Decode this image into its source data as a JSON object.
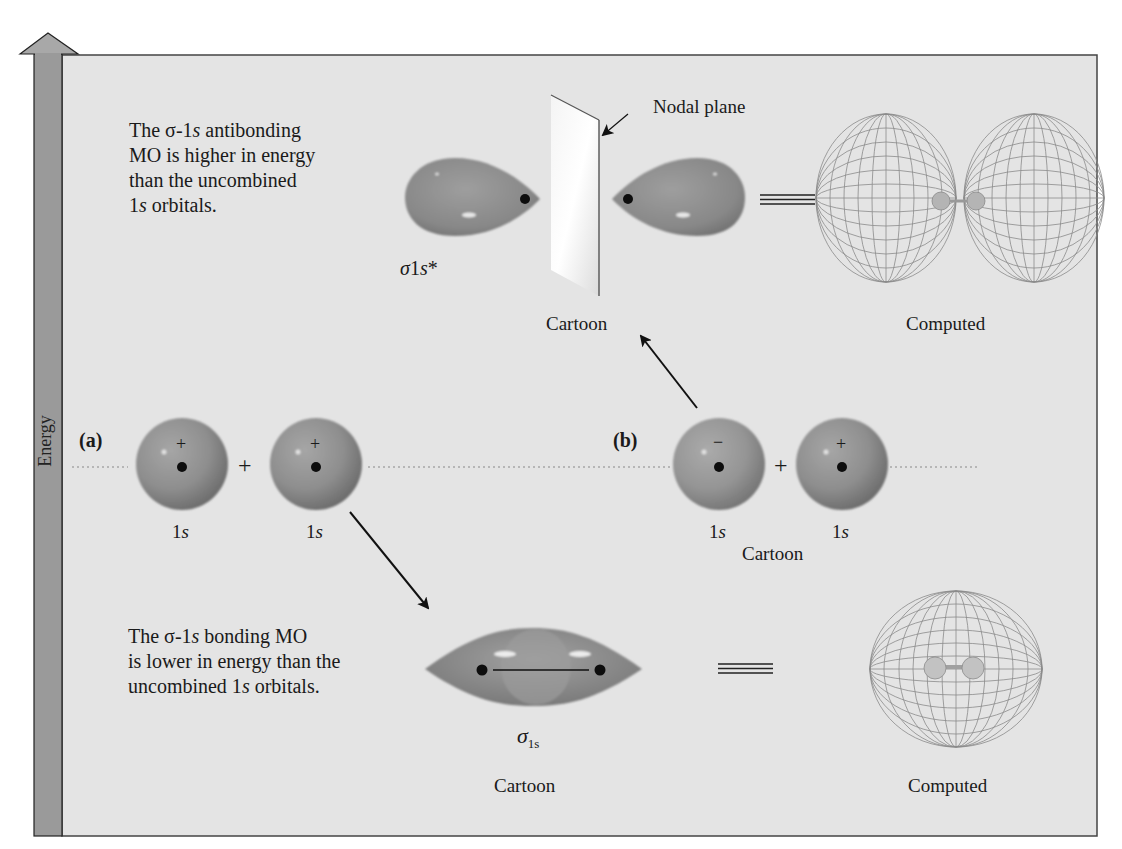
{
  "figure": {
    "axis": {
      "label": "Energy"
    },
    "antibonding": {
      "description_parts": [
        "The σ-1",
        "s",
        " antibonding",
        "MO is higher in energy",
        "than the uncombined",
        "1",
        "s",
        " orbitals."
      ],
      "symbol_sigma": "σ",
      "symbol_1": "1",
      "symbol_s": "s",
      "symbol_star": "*",
      "nodal_plane_label": "Nodal plane",
      "cartoon_label": "Cartoon",
      "computed_label": "Computed"
    },
    "row_a": {
      "tag": "(a)",
      "orbital_label_num": "1",
      "orbital_label_s": "s",
      "phase_left": "+",
      "phase_right": "+",
      "combine": "+"
    },
    "row_b": {
      "tag": "(b)",
      "orbital_label_num": "1",
      "orbital_label_s": "s",
      "phase_left": "−",
      "phase_right": "+",
      "combine": "+",
      "cartoon_label": "Cartoon"
    },
    "bonding": {
      "description_parts": [
        "The σ-1",
        "s",
        " bonding MO",
        "is lower in energy than the",
        "uncombined 1",
        "s",
        " orbitals."
      ],
      "symbol_sigma": "σ",
      "symbol_sub": "1s",
      "cartoon_label": "Cartoon",
      "computed_label": "Computed"
    },
    "colors": {
      "panel_fill": "#e4e4e4",
      "energy_bar": "#9a9a9a",
      "orbital": "#8c8c8c",
      "wireframe": "#8a8a8a"
    }
  }
}
